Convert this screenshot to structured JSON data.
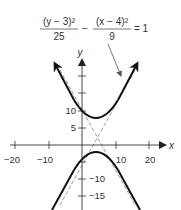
{
  "equation": {
    "frac1_num": "(y − 3)²",
    "frac1_den": "25",
    "minus": "−",
    "frac2_num": "(x − 4)²",
    "frac2_den": "9",
    "equals": "= 1"
  },
  "axes": {
    "x_label": "x",
    "y_label": "y",
    "x_ticks": [
      "−20",
      "−10",
      "10",
      "20"
    ],
    "y_ticks": [
      "10",
      "5",
      "−10",
      "−15"
    ]
  },
  "colors": {
    "curve": "#222222",
    "asymptote": "#888888",
    "axis": "#333333",
    "text": "#333333"
  }
}
